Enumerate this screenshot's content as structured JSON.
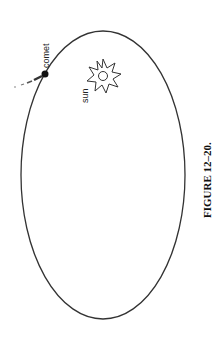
{
  "figure": {
    "caption": "FIGURE 12–20.",
    "orientation": "rotated 90° counter-clockwise",
    "labels": {
      "comet": "comet",
      "sun": "sun"
    },
    "elements": {
      "orbit": "ellipse",
      "sun_icon": "sun-icon",
      "comet_icon": "comet-icon"
    },
    "colors": {
      "stroke": "#333333",
      "background": "#ffffff"
    }
  }
}
